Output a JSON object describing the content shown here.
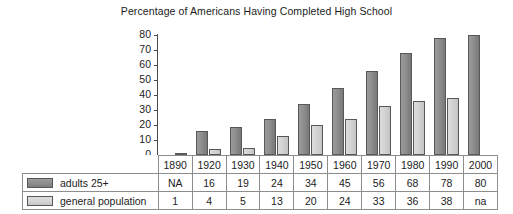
{
  "chart_data": {
    "type": "bar",
    "title": "Percentage of Americans Having Completed High School",
    "xlabel": "",
    "ylabel": "",
    "ylim": [
      0,
      80
    ],
    "yticks": [
      0,
      10,
      20,
      30,
      40,
      50,
      60,
      70,
      80
    ],
    "ytick_labels": [
      "0",
      "10",
      "20",
      "30",
      "40",
      "50",
      "60",
      "70",
      "80"
    ],
    "grid": false,
    "legend_position": "table-left",
    "categories": [
      "1890",
      "1920",
      "1930",
      "1940",
      "1950",
      "1960",
      "1970",
      "1980",
      "1990",
      "2000"
    ],
    "series": [
      {
        "name": "adults 25+",
        "color": "#8c8c8c",
        "values": [
          null,
          16,
          19,
          24,
          34,
          45,
          56,
          68,
          78,
          80
        ],
        "value_labels": [
          "NA",
          "16",
          "19",
          "24",
          "34",
          "45",
          "56",
          "68",
          "78",
          "80"
        ]
      },
      {
        "name": "general population",
        "color": "#d4d4d4",
        "values": [
          1,
          4,
          5,
          13,
          20,
          24,
          33,
          36,
          38,
          null
        ],
        "value_labels": [
          "1",
          "4",
          "5",
          "13",
          "20",
          "24",
          "33",
          "36",
          "38",
          "na"
        ]
      }
    ]
  },
  "table": {
    "corner_label": "",
    "row_label_0": "adults 25+",
    "row_label_1": "general population"
  },
  "colors": {
    "series_dark": "#8c8c8c",
    "series_light": "#d4d4d4",
    "axis": "#4b4b4b",
    "border": "#8d8d8d",
    "text": "#1c1c1c",
    "background": "#ffffff"
  }
}
